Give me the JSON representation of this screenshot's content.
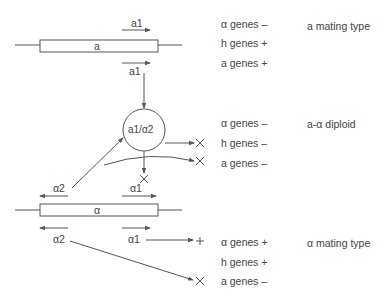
{
  "diagram": {
    "colors": {
      "line": "#555555",
      "text": "#444444",
      "background": "#ffffff"
    },
    "sections": [
      {
        "id": "a-mating",
        "locus_label": "a",
        "transcripts": [
          "a1",
          "a1"
        ],
        "genes": [
          {
            "name": "α genes",
            "state": "–"
          },
          {
            "name": "h genes",
            "state": "+"
          },
          {
            "name": "a genes",
            "state": "+"
          }
        ],
        "outcome": "a mating type"
      },
      {
        "id": "diploid",
        "complex_label": "a1/α2",
        "genes": [
          {
            "name": "α genes",
            "state": "–"
          },
          {
            "name": "h genes",
            "state": "–"
          },
          {
            "name": "a genes",
            "state": "–"
          }
        ],
        "outcome": "a-α diploid"
      },
      {
        "id": "alpha-mating",
        "locus_label": "α",
        "transcripts": [
          "α2",
          "α1",
          "α2",
          "α1"
        ],
        "genes": [
          {
            "name": "α genes",
            "state": "+"
          },
          {
            "name": "h genes",
            "state": "+"
          },
          {
            "name": "a genes",
            "state": "–"
          }
        ],
        "outcome": "α mating type"
      }
    ],
    "symbols": {
      "blocked": "×",
      "active": "+"
    }
  }
}
